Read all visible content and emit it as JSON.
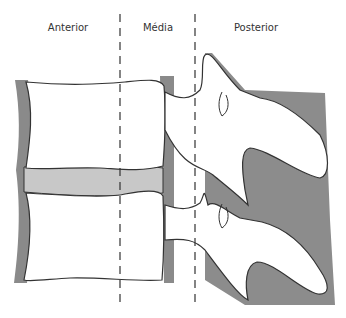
{
  "diagram": {
    "columns": [
      {
        "label": "Anterior",
        "x": 68
      },
      {
        "label": "Média",
        "x": 158
      },
      {
        "label": "Posterior",
        "x": 256
      }
    ],
    "dividers": [
      {
        "name": "anterior-middle-divider",
        "x": 120
      },
      {
        "name": "middle-posterior-divider",
        "x": 195
      }
    ],
    "colors": {
      "ligament": "#8a8a8a",
      "disc": "#c8c8c8",
      "bone": "#ffffff",
      "outline": "#333333",
      "posterior_shade": "#8c8c8c"
    }
  }
}
